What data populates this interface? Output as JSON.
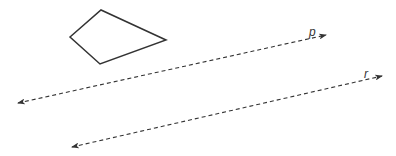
{
  "diagram": {
    "quadrilateral": {
      "points": [
        [
          70,
          37
        ],
        [
          101,
          10
        ],
        [
          166,
          40
        ],
        [
          100,
          64
        ]
      ],
      "stroke": "#333333"
    },
    "lines": [
      {
        "label": "p",
        "from": [
          18,
          103
        ],
        "to": [
          326,
          35
        ],
        "label_pos": [
          309,
          36
        ]
      },
      {
        "label": "r",
        "from": [
          72,
          147
        ],
        "to": [
          382,
          76
        ],
        "label_pos": [
          364,
          78
        ]
      }
    ]
  }
}
